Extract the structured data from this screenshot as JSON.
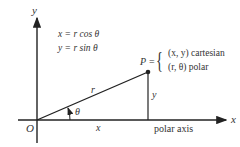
{
  "diagram": {
    "axis_labels": {
      "x": "x",
      "y": "y",
      "origin": "O"
    },
    "equations": [
      "x = r cos θ",
      "y = r sin θ"
    ],
    "point": {
      "name": "P",
      "equals": "=",
      "cartesian": "(x, y) cartesian",
      "polar": "(r, θ) polar"
    },
    "segment_labels": {
      "r": "r",
      "x": "x",
      "y": "y",
      "theta": "θ"
    },
    "polar_axis_label": "polar axis",
    "colors": {
      "line": "#222222",
      "text": "#333333"
    }
  }
}
